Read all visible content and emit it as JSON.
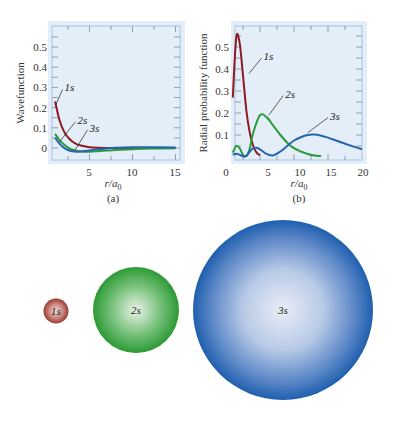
{
  "chart_data": [
    {
      "id": "a",
      "type": "line",
      "panel_label": "(a)",
      "ylabel": "Wavefunction",
      "xlabel": "r/a",
      "xlabel_sub": "0",
      "xlim": [
        1,
        15
      ],
      "ylim": [
        -0.04,
        0.6
      ],
      "xticks": [
        5,
        10,
        15
      ],
      "yticks": [
        0,
        0.1,
        0.2,
        0.3,
        0.4,
        0.5
      ],
      "ytick_labels": [
        "0",
        "0.1",
        "0.2",
        "0.3",
        "0.4",
        "0.5"
      ],
      "grid": false,
      "series": [
        {
          "name": "1s",
          "label_x": 2.1,
          "label_y": 0.28,
          "point_x": 1.05,
          "point_y": 0.21,
          "x": [
            1,
            1.5,
            2,
            2.5,
            3,
            3.5,
            4,
            5,
            6,
            8,
            10,
            15
          ],
          "y": [
            0.23,
            0.14,
            0.085,
            0.052,
            0.032,
            0.019,
            0.012,
            0.004,
            0.0015,
            0.0003,
            0.0001,
            0
          ]
        },
        {
          "name": "2s",
          "label_x": 3.6,
          "label_y": 0.12,
          "point_x": 1.5,
          "point_y": 0.03,
          "x": [
            1,
            1.5,
            2,
            2.5,
            3,
            3.5,
            4,
            5,
            6,
            7,
            8,
            10,
            12,
            15
          ],
          "y": [
            0.07,
            0.04,
            0.018,
            0.002,
            -0.008,
            -0.014,
            -0.017,
            -0.018,
            -0.016,
            -0.013,
            -0.01,
            -0.006,
            -0.003,
            -0.001
          ]
        },
        {
          "name": "3s",
          "label_x": 5.0,
          "label_y": 0.08,
          "point_x": 3.3,
          "point_y": -0.012,
          "x": [
            1,
            1.5,
            2,
            2.5,
            3,
            3.5,
            4,
            5,
            6,
            7,
            8,
            10,
            12,
            15
          ],
          "y": [
            0.05,
            0.022,
            0.002,
            -0.01,
            -0.016,
            -0.018,
            -0.017,
            -0.012,
            -0.006,
            -0.002,
            0.001,
            0.004,
            0.004,
            0.003
          ]
        }
      ]
    },
    {
      "id": "b",
      "type": "line",
      "panel_label": "(b)",
      "ylabel": "Radial probability function",
      "xlabel": "r/a",
      "xlabel_sub": "0",
      "xlim": [
        0,
        20
      ],
      "ylim": [
        0,
        0.6
      ],
      "xticks": [
        0,
        5,
        10,
        15,
        20
      ],
      "yticks": [
        0.1,
        0.2,
        0.3,
        0.4,
        0.5
      ],
      "ytick_labels": [
        "0.1",
        "0.2",
        "0.3",
        "0.4",
        "0.5"
      ],
      "grid": false,
      "series": [
        {
          "name": "1s",
          "label_x": 5.5,
          "label_y": 0.44,
          "point_x": 3.4,
          "point_y": 0.38,
          "x": [
            1,
            1.5,
            2,
            2.5,
            3,
            3.5,
            4,
            4.5,
            5
          ],
          "y": [
            0.27,
            0.54,
            0.52,
            0.37,
            0.21,
            0.11,
            0.05,
            0.02,
            0.008
          ]
        },
        {
          "name": "2s",
          "label_x": 8.7,
          "label_y": 0.27,
          "point_x": 6.3,
          "point_y": 0.19,
          "x": [
            1,
            1.5,
            2,
            2.5,
            3,
            3.5,
            4,
            5,
            6,
            7,
            8,
            9,
            10,
            11,
            12,
            13,
            14
          ],
          "y": [
            0.02,
            0.05,
            0.04,
            0.01,
            0.005,
            0.04,
            0.11,
            0.19,
            0.18,
            0.14,
            0.1,
            0.065,
            0.04,
            0.025,
            0.014,
            0.007,
            0.004
          ]
        },
        {
          "name": "3s",
          "label_x": 15.3,
          "label_y": 0.17,
          "point_x": 12.0,
          "point_y": 0.11,
          "x": [
            1,
            1.5,
            2,
            2.5,
            3,
            3.5,
            4,
            4.5,
            5,
            6,
            7,
            8,
            9,
            10,
            11,
            12,
            13,
            14,
            15,
            16,
            17,
            18,
            19,
            20
          ],
          "y": [
            0.01,
            0.015,
            0.01,
            0.003,
            0.005,
            0.025,
            0.04,
            0.042,
            0.035,
            0.013,
            0.008,
            0.025,
            0.05,
            0.075,
            0.09,
            0.1,
            0.102,
            0.097,
            0.088,
            0.077,
            0.066,
            0.055,
            0.045,
            0.035
          ]
        }
      ]
    }
  ],
  "orbitals": [
    {
      "name": "1s",
      "label": "1s",
      "relative_size": 1,
      "color_edge": "#9e3a34",
      "color_center": "#f3ddd8"
    },
    {
      "name": "2s",
      "label": "2s",
      "relative_size": 3.6,
      "color_edge": "#2c9a35",
      "color_center": "#e8f3e6"
    },
    {
      "name": "3s",
      "label": "3s",
      "relative_size": 7.5,
      "color_edge": "#1f5fae",
      "color_center": "#e9eef7"
    }
  ],
  "colors": {
    "panel_bg": "#e3eef8",
    "frame": "#b9d4ea",
    "s1": "#8e1b22",
    "s2": "#2a9a3a",
    "s3": "#2765b0"
  }
}
